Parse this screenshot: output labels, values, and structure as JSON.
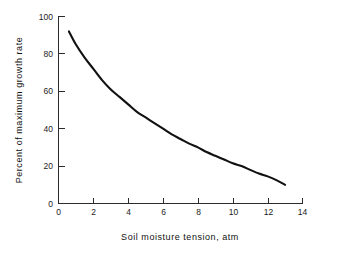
{
  "chart_data": {
    "type": "line",
    "title": "",
    "subtitle": "",
    "xlabel": "Soil moisture tension, atm",
    "ylabel": "Percent of maximum growth rate",
    "xlim": [
      0,
      14
    ],
    "ylim": [
      0,
      100
    ],
    "xticks": [
      0,
      2,
      4,
      6,
      8,
      10,
      12,
      14
    ],
    "xticklabels": [
      "0",
      "2",
      "4",
      "6",
      "8",
      "10",
      "12",
      "14"
    ],
    "yticks": [
      0,
      20,
      40,
      60,
      80,
      100
    ],
    "yticklabels": [
      "0",
      "20",
      "40",
      "60",
      "80",
      "100"
    ],
    "grid": false,
    "legend": false,
    "legend_position": "none",
    "line_color": "#111111",
    "axis_color": "#2b2b2b",
    "background_color": "#ffffff",
    "series": [
      {
        "name": "Growth rate vs soil moisture tension",
        "x": [
          0.6,
          1.0,
          1.5,
          2.0,
          2.5,
          3.0,
          3.5,
          4.0,
          4.5,
          5.0,
          5.5,
          6.0,
          6.5,
          7.0,
          7.5,
          8.0,
          8.5,
          9.0,
          9.5,
          10.0,
          10.5,
          11.0,
          11.5,
          12.0,
          12.5,
          13.0
        ],
        "y": [
          92,
          85,
          78,
          72,
          66,
          61,
          57,
          53,
          49,
          46,
          43,
          40,
          37,
          34.5,
          32,
          30,
          27.5,
          25.5,
          23.5,
          21.5,
          20,
          18,
          16,
          14.5,
          12.5,
          10
        ]
      }
    ]
  },
  "axis_labels": {
    "x_title": "Soil moisture tension, atm",
    "y_title": "Percent of maximum growth rate"
  }
}
